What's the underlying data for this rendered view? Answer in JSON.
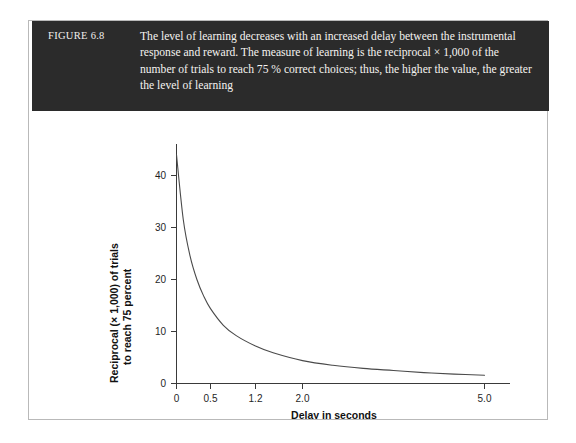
{
  "figure": {
    "number_label": "FIGURE 6.8",
    "caption": "The level of learning decreases with an increased delay between the instrumental response and reward. The measure of learning is the reciprocal × 1,000 of the number of trials to reach 75 % correct choices; thus, the higher the value, the greater the level of learning"
  },
  "chart_data": {
    "type": "line",
    "title": "",
    "xlabel": "Delay in seconds",
    "ylabel_line1": "Reciprocal (× 1,000) of trials",
    "ylabel_line2": "to reach 75 percent",
    "xticks": [
      "0",
      "0.5",
      "1.2",
      "2.0",
      "5.0"
    ],
    "xtick_values": [
      0,
      0.5,
      1.2,
      2.0,
      5.0
    ],
    "yticks": [
      "0",
      "10",
      "20",
      "30",
      "40"
    ],
    "ytick_values": [
      0,
      10,
      20,
      30,
      40
    ],
    "ylim": [
      0,
      46
    ],
    "xlim": [
      0,
      5.6
    ],
    "grid": false,
    "legend": "none",
    "x": [
      0,
      0.1,
      0.2,
      0.3,
      0.4,
      0.5,
      0.7,
      0.9,
      1.2,
      1.5,
      2.0,
      2.5,
      3.0,
      3.5,
      4.0,
      4.5,
      5.0
    ],
    "y": [
      44.0,
      31.5,
      24.5,
      20.0,
      16.8,
      14.4,
      11.2,
      9.2,
      7.2,
      5.9,
      4.4,
      3.5,
      2.9,
      2.5,
      2.1,
      1.8,
      1.6
    ],
    "series": [
      {
        "name": "Reciprocal (x 1,000) of trials to reach 75 percent",
        "values": [
          44.0,
          31.5,
          24.5,
          20.0,
          16.8,
          14.4,
          11.2,
          9.2,
          7.2,
          5.9,
          4.4,
          3.5,
          2.9,
          2.5,
          2.1,
          1.8,
          1.6
        ]
      }
    ]
  },
  "colors": {
    "caption_band": "#2b2b2b",
    "caption_text": "#f5f3f0",
    "axis": "#3a3a3a",
    "curve": "#4a4a4a",
    "frame_border": "#b9b9b9"
  }
}
